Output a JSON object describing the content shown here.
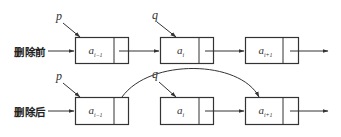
{
  "diagram": {
    "type": "linked-list-deletion",
    "rows": [
      {
        "id": "before",
        "label": "删除前",
        "pointers": [
          {
            "name": "p",
            "target_node": 0
          },
          {
            "name": "q",
            "target_node": 1
          }
        ],
        "nodes": [
          {
            "base": "a",
            "sub": "i−1"
          },
          {
            "base": "a",
            "sub": "i"
          },
          {
            "base": "a",
            "sub": "i+1"
          }
        ]
      },
      {
        "id": "after",
        "label": "删除后",
        "pointers": [
          {
            "name": "p",
            "target_node": 0
          },
          {
            "name": "q",
            "target_node": 1
          }
        ],
        "nodes": [
          {
            "base": "a",
            "sub": "i−1"
          },
          {
            "base": "a",
            "sub": "i"
          },
          {
            "base": "a",
            "sub": "i+1"
          }
        ],
        "bypass_link": {
          "from_node": 0,
          "to_node": 2
        }
      }
    ],
    "colors": {
      "stroke": "#333333",
      "background": "#ffffff"
    }
  }
}
